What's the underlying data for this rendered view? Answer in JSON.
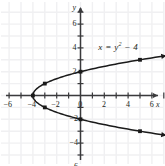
{
  "figure": {
    "title": "",
    "background_color": "#ffffff",
    "grid_color": "#f0f0f2",
    "axis_color": "#3a3a3c",
    "curve_color": "#1a1a1a",
    "text_color": "#231f20"
  },
  "axis_names": {
    "x": "x",
    "y": "y"
  },
  "equation": {
    "lhs": "x",
    "eq": "=",
    "var": "y",
    "exp": "2",
    "rest": "− 4",
    "full": "x = y² − 4"
  },
  "chart_data": {
    "type": "line",
    "title": "",
    "subtitle": "",
    "xlabel": "x",
    "ylabel": "y",
    "xlim": [
      -7.5,
      7.5
    ],
    "ylim": [
      -7.5,
      7.5
    ],
    "grid": true,
    "legend_position": "none",
    "annotations": [
      {
        "text": "x = y² − 4",
        "x": 1.5,
        "y": 4.2
      }
    ],
    "xticks": [
      -7,
      -6,
      -5,
      -4,
      -3,
      -2,
      -1,
      0,
      1,
      2,
      3,
      4,
      5,
      6,
      7
    ],
    "yticks": [
      -7,
      -6,
      -5,
      -4,
      -3,
      -2,
      -1,
      0,
      1,
      2,
      3,
      4,
      5,
      6,
      7
    ],
    "xtick_labels": [
      {
        "value": -6,
        "label": "−6"
      },
      {
        "value": -4,
        "label": "−4"
      },
      {
        "value": -2,
        "label": "−2"
      },
      {
        "value": 0,
        "label": "0"
      },
      {
        "value": 2,
        "label": "2"
      },
      {
        "value": 4,
        "label": "4"
      },
      {
        "value": 6,
        "label": "6"
      }
    ],
    "ytick_labels": [
      {
        "value": 6,
        "label": "6"
      },
      {
        "value": 4,
        "label": "4"
      },
      {
        "value": 2,
        "label": "2"
      },
      {
        "value": -2,
        "label": "−2"
      },
      {
        "value": -4,
        "label": "−4"
      },
      {
        "value": -6,
        "label": "−6"
      }
    ],
    "series": [
      {
        "name": "x = y² − 4",
        "equation": "x = y^2 - 4",
        "y_domain": [
          -3.35,
          3.35
        ],
        "arrow_ends": [
          "upper-right",
          "lower-right"
        ],
        "points": [
          {
            "x": -4,
            "y": 0,
            "label": "vertex"
          },
          {
            "x": -3,
            "y": 1,
            "label": ""
          },
          {
            "x": -3,
            "y": -1,
            "label": ""
          },
          {
            "x": 0,
            "y": 2,
            "label": ""
          },
          {
            "x": 0,
            "y": -2,
            "label": ""
          },
          {
            "x": 5,
            "y": 3,
            "label": ""
          },
          {
            "x": 5,
            "y": -3,
            "label": ""
          }
        ]
      }
    ]
  }
}
